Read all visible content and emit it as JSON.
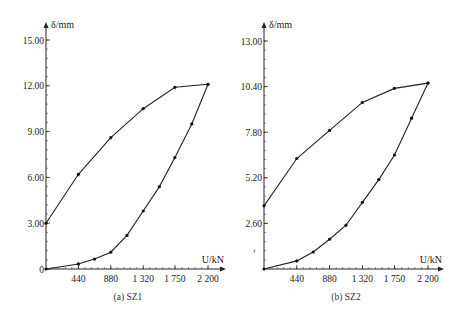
{
  "chart_data": [
    {
      "type": "line",
      "caption": "(a) SZ1",
      "xlabel": "U/kN",
      "ylabel": "δ/mm",
      "xlim": [
        0,
        2420
      ],
      "ylim": [
        0,
        15.5
      ],
      "x_ticks": [
        440,
        880,
        1320,
        1750,
        2200
      ],
      "x_tick_labels": [
        "440",
        "880",
        "1 320",
        "1 750",
        "2 200"
      ],
      "y_ticks": [
        0,
        3.0,
        6.0,
        9.0,
        12.0,
        15.0
      ],
      "y_tick_labels": [
        "0",
        "3.00",
        "6.00",
        "9.00",
        "12.00",
        "15.00"
      ],
      "grid": false,
      "series": [
        {
          "name": "unloading (upper branch)",
          "x": [
            0,
            440,
            880,
            1320,
            1750,
            2200
          ],
          "values": [
            3.0,
            6.2,
            8.6,
            10.5,
            11.9,
            12.1
          ]
        },
        {
          "name": "loading (lower branch)",
          "x": [
            0,
            440,
            660,
            880,
            1100,
            1320,
            1540,
            1750,
            1980,
            2200
          ],
          "values": [
            0,
            0.33,
            0.65,
            1.1,
            2.2,
            3.8,
            5.4,
            7.3,
            9.5,
            12.1
          ]
        }
      ]
    },
    {
      "type": "line",
      "caption": "(b) SZ2",
      "xlabel": "U/kN",
      "ylabel": "δ/mm",
      "xlim": [
        0,
        2420
      ],
      "ylim": [
        0,
        13.5
      ],
      "x_ticks": [
        440,
        880,
        1320,
        1750,
        2200
      ],
      "x_tick_labels": [
        "440",
        "880",
        "1 320",
        "1 750",
        "2 200"
      ],
      "y_ticks": [
        2.6,
        5.2,
        7.8,
        10.4,
        13.0
      ],
      "y_tick_labels": [
        "2.60",
        "5.20",
        "7.80",
        "10.40",
        "13.00"
      ],
      "grid": false,
      "series": [
        {
          "name": "unloading (upper branch)",
          "x": [
            0,
            440,
            880,
            1320,
            1750,
            2200
          ],
          "values": [
            3.6,
            6.3,
            7.9,
            9.5,
            10.3,
            10.6
          ]
        },
        {
          "name": "loading (lower branch)",
          "x": [
            0,
            440,
            660,
            880,
            1100,
            1320,
            1540,
            1750,
            1980,
            2200
          ],
          "values": [
            0,
            0.46,
            0.97,
            1.7,
            2.5,
            3.8,
            5.1,
            6.5,
            8.6,
            10.6
          ]
        }
      ]
    }
  ]
}
